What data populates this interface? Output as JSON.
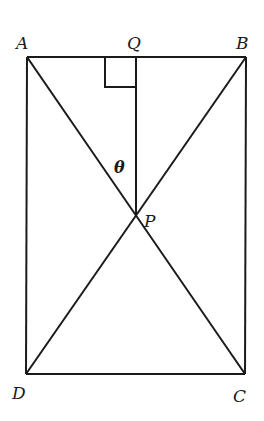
{
  "diagram": {
    "points": {
      "A": {
        "label": "A",
        "x": 27,
        "y": 57
      },
      "B": {
        "label": "B",
        "x": 246,
        "y": 57
      },
      "C": {
        "label": "C",
        "x": 245,
        "y": 374
      },
      "D": {
        "label": "D",
        "x": 26,
        "y": 374
      },
      "Q": {
        "label": "Q",
        "x": 136,
        "y": 57
      },
      "P": {
        "label": "P",
        "x": 136,
        "y": 215
      }
    },
    "angle_label": "θ",
    "segments": [
      "AB",
      "BC",
      "CD",
      "DA",
      "AC",
      "BD",
      "QP"
    ],
    "right_angle_at": "Q",
    "colors": {
      "line": "#1a1a1a",
      "background": "#ffffff"
    }
  }
}
